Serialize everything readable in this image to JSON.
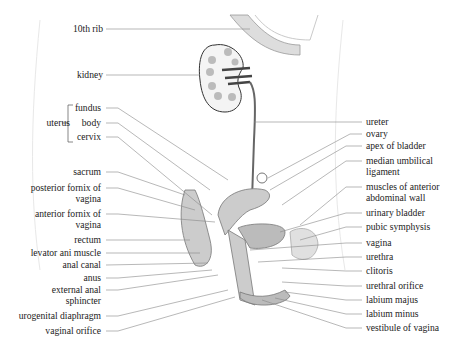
{
  "figure": {
    "left_labels": [
      {
        "id": "10th-rib",
        "text": "10th rib",
        "x": 103,
        "y": 29
      },
      {
        "id": "kidney",
        "text": "kidney",
        "x": 103,
        "y": 75
      },
      {
        "id": "uterus-fundus",
        "text": "fundus",
        "x": 101,
        "y": 108
      },
      {
        "id": "uterus-body",
        "text": "body",
        "x": 101,
        "y": 123
      },
      {
        "id": "uterus-cervix",
        "text": "cervix",
        "x": 101,
        "y": 137
      },
      {
        "id": "sacrum",
        "text": "sacrum",
        "x": 101,
        "y": 172
      },
      {
        "id": "posterior-fornix",
        "text": "posterior fornix of",
        "text2": "vagina",
        "x": 101,
        "y": 188
      },
      {
        "id": "anterior-fornix",
        "text": "anterior fornix of",
        "text2": "vagina",
        "x": 101,
        "y": 214
      },
      {
        "id": "rectum",
        "text": "rectum",
        "x": 101,
        "y": 240
      },
      {
        "id": "levator-ani",
        "text": "levator ani muscle",
        "x": 101,
        "y": 253
      },
      {
        "id": "anal-canal",
        "text": "anal canal",
        "x": 101,
        "y": 265
      },
      {
        "id": "anus",
        "text": "anus",
        "x": 101,
        "y": 278
      },
      {
        "id": "external-anal-sphincter",
        "text": "external anal",
        "text2": "sphincter",
        "x": 101,
        "y": 290
      },
      {
        "id": "urogenital-diaphragm",
        "text": "urogenital diaphragm",
        "x": 101,
        "y": 316
      },
      {
        "id": "vaginal-orifice",
        "text": "vaginal orifice",
        "x": 101,
        "y": 331
      }
    ],
    "group_label": {
      "text": "uterus",
      "x": 62,
      "y": 123
    },
    "right_labels": [
      {
        "id": "ureter",
        "text": "ureter",
        "x": 366,
        "y": 122
      },
      {
        "id": "ovary",
        "text": "ovary",
        "x": 366,
        "y": 134
      },
      {
        "id": "apex-of-bladder",
        "text": "apex of bladder",
        "x": 366,
        "y": 146
      },
      {
        "id": "median-umbilical-ligament",
        "text": "median umbilical",
        "text2": "ligament",
        "x": 366,
        "y": 161
      },
      {
        "id": "muscles-anterior-abdominal-wall",
        "text": "muscles of anterior",
        "text2": "abdominal wall",
        "x": 366,
        "y": 187
      },
      {
        "id": "urinary-bladder",
        "text": "urinary bladder",
        "x": 366,
        "y": 213
      },
      {
        "id": "pubic-symphysis",
        "text": "pubic symphysis",
        "x": 366,
        "y": 227
      },
      {
        "id": "vagina",
        "text": "vagina",
        "x": 366,
        "y": 243
      },
      {
        "id": "urethra",
        "text": "urethra",
        "x": 366,
        "y": 257
      },
      {
        "id": "clitoris",
        "text": "clitoris",
        "x": 366,
        "y": 271
      },
      {
        "id": "urethral-orifice",
        "text": "urethral orifice",
        "x": 366,
        "y": 286
      },
      {
        "id": "labium-majus",
        "text": "labium majus",
        "x": 366,
        "y": 300
      },
      {
        "id": "labium-minus",
        "text": "labium minus",
        "x": 366,
        "y": 314
      },
      {
        "id": "vestibule-of-vagina",
        "text": "vestibule of vagina",
        "x": 366,
        "y": 328
      }
    ]
  }
}
